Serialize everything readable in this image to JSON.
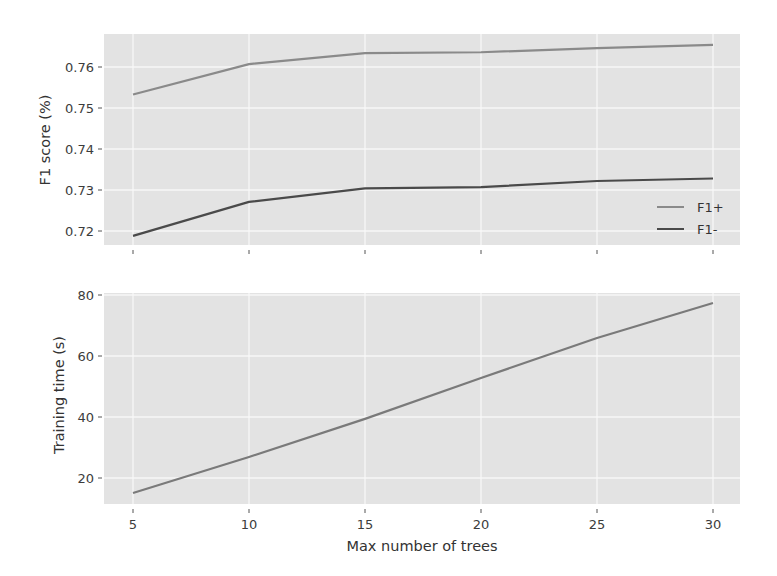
{
  "chart_data": [
    {
      "type": "line",
      "title": "",
      "xlabel": "",
      "ylabel": "F1 score (%)",
      "x": [
        5,
        10,
        15,
        20,
        25,
        30
      ],
      "xticks": [
        5,
        10,
        15,
        20,
        25,
        30
      ],
      "xtick_labels_visible": false,
      "ylim": [
        0.7165,
        0.7675
      ],
      "yticks": [
        0.72,
        0.73,
        0.74,
        0.75,
        0.76
      ],
      "ytick_labels": [
        "0.72",
        "0.73",
        "0.74",
        "0.75",
        "0.76"
      ],
      "grid": true,
      "legend_position": "lower right",
      "series": [
        {
          "name": "F1+",
          "color": "#8a8a8a",
          "values": [
            0.7533,
            0.7607,
            0.7634,
            0.7636,
            0.7646,
            0.7654
          ]
        },
        {
          "name": "F1-",
          "color": "#4a4a4a",
          "values": [
            0.7188,
            0.7271,
            0.7304,
            0.7307,
            0.7322,
            0.7328
          ]
        }
      ]
    },
    {
      "type": "line",
      "title": "",
      "xlabel": "Max number of trees",
      "ylabel": "Training time (s)",
      "x": [
        5,
        10,
        15,
        20,
        25,
        30
      ],
      "xticks": [
        5,
        10,
        15,
        20,
        25,
        30
      ],
      "xtick_labels": [
        "5",
        "10",
        "15",
        "20",
        "25",
        "30"
      ],
      "ylim": [
        12,
        80.5
      ],
      "yticks": [
        20,
        40,
        60,
        80
      ],
      "ytick_labels": [
        "20",
        "40",
        "60",
        "80"
      ],
      "grid": true,
      "series": [
        {
          "name": "Training time",
          "color": "#7a7a7a",
          "values": [
            15.1,
            26.9,
            39.4,
            52.8,
            65.9,
            77.4
          ]
        }
      ]
    }
  ]
}
